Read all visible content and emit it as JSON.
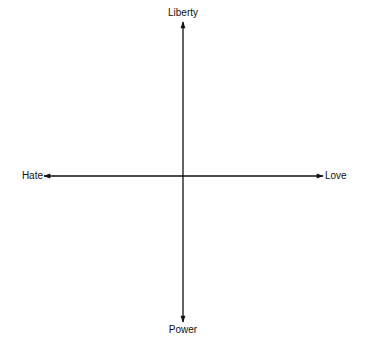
{
  "diagram": {
    "type": "quadrant-axes",
    "axes": {
      "vertical": {
        "top_label": "Liberty",
        "bottom_label": "Power"
      },
      "horizontal": {
        "left_label": "Hate",
        "right_label": "Love"
      }
    },
    "colors": {
      "line": "#111111",
      "background": "#ffffff"
    }
  }
}
